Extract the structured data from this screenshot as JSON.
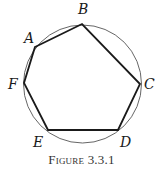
{
  "figure": {
    "caption": "Figure 3.3.1",
    "circle": {
      "cx": 82.5,
      "cy": 84,
      "r": 59,
      "stroke": "#555555"
    },
    "polygon_stroke": "#1a1a1a",
    "vertices": [
      {
        "label": "A",
        "x": 35,
        "y": 47,
        "lx": 24,
        "ly": 43
      },
      {
        "label": "B",
        "x": 82,
        "y": 24,
        "lx": 78,
        "ly": 14
      },
      {
        "label": "C",
        "x": 140,
        "y": 84,
        "lx": 144,
        "ly": 89
      },
      {
        "label": "D",
        "x": 118,
        "y": 130,
        "lx": 120,
        "ly": 147
      },
      {
        "label": "E",
        "x": 48,
        "y": 130,
        "lx": 33,
        "ly": 147
      },
      {
        "label": "F",
        "x": 24,
        "y": 83,
        "lx": 8,
        "ly": 89
      }
    ],
    "polygon_order": [
      "A",
      "B",
      "C",
      "D",
      "E",
      "F"
    ]
  }
}
